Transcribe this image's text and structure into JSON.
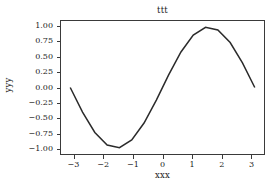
{
  "chart_data": {
    "type": "line",
    "title": "ttt",
    "xlabel": "xxx",
    "ylabel": "yyy",
    "xlim": [
      -3.4557519189487724,
      3.4557519189487724
    ],
    "ylim": [
      -1.0999999,
      1.0999999
    ],
    "grid": false,
    "legend": null,
    "line_color": "#2b2b2b",
    "line_width": 1.5,
    "background_color": "#ffffff",
    "axes_color": "#3a3a3a",
    "xticks": [
      -3,
      -2,
      -1,
      0,
      1,
      2,
      3
    ],
    "xtick_labels": [
      "−3",
      "−2",
      "−1",
      "0",
      "1",
      "2",
      "3"
    ],
    "yticks": [
      1.0,
      0.75,
      0.5,
      0.25,
      0.0,
      -0.25,
      -0.5,
      -0.75,
      -1.0
    ],
    "ytick_labels": [
      "1.00",
      "0.75",
      "0.50",
      "0.25",
      "0.00",
      "−0.25",
      "−0.50",
      "−0.75",
      "−1.00"
    ],
    "series": [
      {
        "name": "sin(x)",
        "x": [
          -3.14159265,
          -2.72271363,
          -2.30383461,
          -1.88495559,
          -1.46607657,
          -1.04719755,
          -0.62831853,
          -0.20943951,
          0.20943951,
          0.62831853,
          1.04719755,
          1.46607657,
          1.88495559,
          2.30383461,
          2.72271363,
          3.14159265
        ],
        "y": [
          0.0,
          -0.40673664,
          -0.74314483,
          -0.95105652,
          -0.9945219,
          -0.8660254,
          -0.58778525,
          -0.20791169,
          0.20791169,
          0.58778525,
          0.8660254,
          0.9945219,
          0.95105652,
          0.74314483,
          0.40673664,
          0.0
        ]
      }
    ]
  }
}
